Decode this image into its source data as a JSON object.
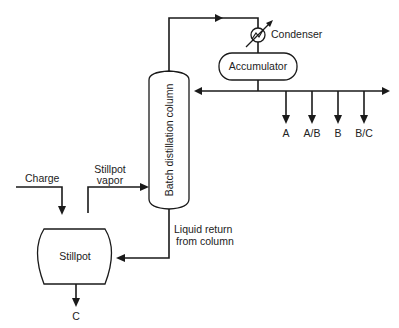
{
  "diagram": {
    "equipment": {
      "column": "Batch distillation column",
      "condenser": "Condenser",
      "accumulator": "Accumulator",
      "stillpot": "Stillpot"
    },
    "streams": {
      "charge": "Charge",
      "stillpot_vapor_line1": "Stillpot",
      "stillpot_vapor_line2": "vapor",
      "liquid_return_line1": "Liquid return",
      "liquid_return_line2": "from column"
    },
    "products": [
      "A",
      "A/B",
      "B",
      "B/C"
    ],
    "bottoms_product": "C"
  }
}
